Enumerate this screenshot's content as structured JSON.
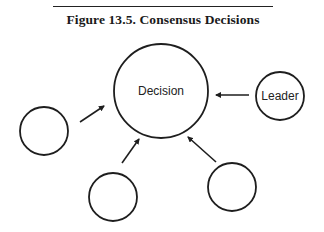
{
  "figure": {
    "caption": "Figure 13.5.  Consensus Decisions"
  },
  "diagram": {
    "colors": {
      "stroke": "#1e1e1e",
      "text": "#222222",
      "background": "#ffffff"
    },
    "nodes": [
      {
        "id": "decision",
        "label": "Decision",
        "cx": 161,
        "cy": 91,
        "r": 47
      },
      {
        "id": "leader",
        "label": "Leader",
        "cx": 280,
        "cy": 96,
        "r": 24
      },
      {
        "id": "participant-left",
        "label": "",
        "cx": 44,
        "cy": 131,
        "r": 24
      },
      {
        "id": "participant-bottom-left",
        "label": "",
        "cx": 113,
        "cy": 197,
        "r": 24
      },
      {
        "id": "participant-bottom-right",
        "label": "",
        "cx": 232,
        "cy": 187,
        "r": 24
      }
    ],
    "edges": [
      {
        "from": "leader",
        "to": "decision",
        "x1": 249,
        "y1": 95,
        "x2": 216,
        "y2": 95
      },
      {
        "from": "participant-left",
        "to": "decision",
        "x1": 80,
        "y1": 122,
        "x2": 104,
        "y2": 106
      },
      {
        "from": "participant-bottom-left",
        "to": "decision",
        "x1": 122,
        "y1": 163,
        "x2": 139,
        "y2": 139
      },
      {
        "from": "participant-bottom-right",
        "to": "decision",
        "x1": 216,
        "y1": 162,
        "x2": 188,
        "y2": 137
      }
    ]
  }
}
